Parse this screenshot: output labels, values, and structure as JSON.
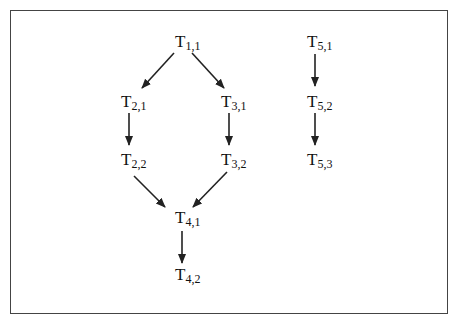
{
  "diagram": {
    "type": "task-dependency-graph",
    "nodes": [
      {
        "id": "T11",
        "letter": "T",
        "sub": "1,1",
        "x": 175,
        "y": 32
      },
      {
        "id": "T21",
        "letter": "T",
        "sub": "2,1",
        "x": 121,
        "y": 92
      },
      {
        "id": "T31",
        "letter": "T",
        "sub": "3,1",
        "x": 221,
        "y": 92
      },
      {
        "id": "T22",
        "letter": "T",
        "sub": "2,2",
        "x": 121,
        "y": 150
      },
      {
        "id": "T32",
        "letter": "T",
        "sub": "3,2",
        "x": 221,
        "y": 150
      },
      {
        "id": "T41",
        "letter": "T",
        "sub": "4,1",
        "x": 175,
        "y": 208
      },
      {
        "id": "T42",
        "letter": "T",
        "sub": "4,2",
        "x": 175,
        "y": 265
      },
      {
        "id": "T51",
        "letter": "T",
        "sub": "5,1",
        "x": 307,
        "y": 32
      },
      {
        "id": "T52",
        "letter": "T",
        "sub": "5,2",
        "x": 307,
        "y": 92
      },
      {
        "id": "T53",
        "letter": "T",
        "sub": "5,3",
        "x": 307,
        "y": 150
      }
    ],
    "edges": [
      {
        "from": "T11",
        "to": "T21",
        "x1": 174,
        "y1": 53,
        "x2": 142,
        "y2": 88
      },
      {
        "from": "T11",
        "to": "T31",
        "x1": 192,
        "y1": 53,
        "x2": 224,
        "y2": 88
      },
      {
        "from": "T21",
        "to": "T22",
        "x1": 129,
        "y1": 113,
        "x2": 129,
        "y2": 145
      },
      {
        "from": "T31",
        "to": "T32",
        "x1": 229,
        "y1": 113,
        "x2": 229,
        "y2": 145
      },
      {
        "from": "T22",
        "to": "T41",
        "x1": 134,
        "y1": 176,
        "x2": 165,
        "y2": 207
      },
      {
        "from": "T32",
        "to": "T41",
        "x1": 227,
        "y1": 172,
        "x2": 193,
        "y2": 207
      },
      {
        "from": "T41",
        "to": "T42",
        "x1": 182,
        "y1": 231,
        "x2": 182,
        "y2": 263
      },
      {
        "from": "T51",
        "to": "T52",
        "x1": 315,
        "y1": 54,
        "x2": 315,
        "y2": 86
      },
      {
        "from": "T52",
        "to": "T53",
        "x1": 315,
        "y1": 113,
        "x2": 315,
        "y2": 145
      }
    ],
    "colors": {
      "stroke": "#222222",
      "border": "#444444",
      "background": "#ffffff"
    }
  }
}
